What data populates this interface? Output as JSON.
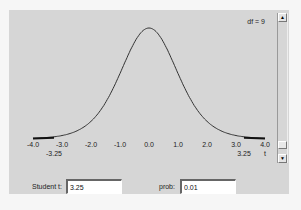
{
  "applet": {
    "df_label": "df = 9",
    "x_ticks": [
      "-4.0",
      "-3.0",
      "-2.0",
      "-1.0",
      "0.0",
      "1.0",
      "2.0",
      "3.0",
      "4.0"
    ],
    "left_marker": "-3.25",
    "right_marker": "3.25",
    "right_marker_axis": "t",
    "scroll_up_icon": "▲",
    "scroll_down_icon": "▼"
  },
  "controls": {
    "student_t_label": "Student t:",
    "student_t_value": "3.25",
    "prob_label": "prob:",
    "prob_value": "0.01"
  },
  "chart_data": {
    "type": "line",
    "degrees_of_freedom": 9,
    "x_range": [
      -4.0,
      4.0
    ],
    "x_ticks": [
      -4.0,
      -3.0,
      -2.0,
      -1.0,
      0.0,
      1.0,
      2.0,
      3.0,
      4.0
    ],
    "xlabel": "t",
    "critical_values": [
      -3.25,
      3.25
    ],
    "shaded_tails": "|t| >= 3.25",
    "tail_probability": 0.01,
    "grid": false
  }
}
